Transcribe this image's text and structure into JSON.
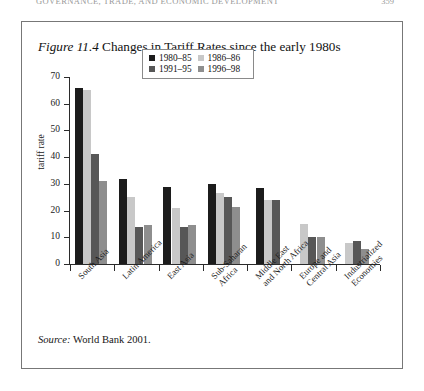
{
  "running_head": {
    "text": "GOVERNANCE, TRADE, AND ECONOMIC DEVELOPMENT",
    "page_number": "359"
  },
  "figure": {
    "label": "Figure 11.4",
    "caption": "Changes in Tariff Rates since the early 1980s",
    "source_label": "Source:",
    "source_text": "World Bank 2001."
  },
  "legend": {
    "entries": [
      {
        "label": "1980–85",
        "color": "#1c1c1c"
      },
      {
        "label": "1991–95",
        "color": "#575757"
      },
      {
        "label": "1986–86",
        "color": "#c8c8c8"
      },
      {
        "label": "1996–98",
        "color": "#8e8e8e"
      }
    ]
  },
  "chart_data": {
    "type": "bar",
    "title": "Changes in Tariff Rates since the early 1980s",
    "xlabel": "",
    "ylabel": "tariff rate",
    "ylim": [
      0,
      70
    ],
    "yticks": [
      0,
      10,
      20,
      30,
      40,
      50,
      60,
      70
    ],
    "grid": false,
    "legend_position": "top-center",
    "categories": [
      "South Asia",
      "Latin America",
      "East Asia",
      "Sub-Saharan Africa",
      "Middle East and North Africa",
      "Europe and Central Asia",
      "Industrialized Economies"
    ],
    "category_lines": [
      [
        "South Asia"
      ],
      [
        "Latin America"
      ],
      [
        "East Asia"
      ],
      [
        "Sub-Saharan",
        "Africa"
      ],
      [
        "Middle East",
        "and North Africa"
      ],
      [
        "Europe and",
        "Central Asia"
      ],
      [
        "Industrialized",
        "Economies"
      ]
    ],
    "series": [
      {
        "name": "1980–85",
        "color": "#1c1c1c",
        "values": [
          66,
          32,
          29,
          30,
          28.5,
          null,
          null
        ]
      },
      {
        "name": "1986–86",
        "color": "#c8c8c8",
        "values": [
          65,
          25,
          21,
          26.5,
          24,
          15,
          8
        ]
      },
      {
        "name": "1991–95",
        "color": "#575757",
        "values": [
          41,
          14,
          14,
          25,
          24,
          10,
          8.5
        ]
      },
      {
        "name": "1996–98",
        "color": "#8e8e8e",
        "values": [
          31,
          14.5,
          14.5,
          21.5,
          null,
          10,
          5.5
        ]
      }
    ]
  }
}
